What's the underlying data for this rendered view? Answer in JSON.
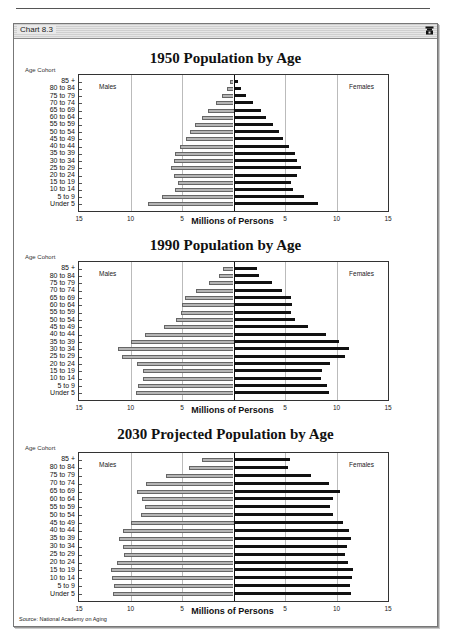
{
  "page": {
    "header_text": "Systemic Risk and Retirement"
  },
  "window": {
    "title": "Chart 8.3",
    "icon": "phone-icon",
    "source": "Source: National Academy on Aging"
  },
  "colors": {
    "male_bar": "#b5b5b5",
    "female_bar": "#111111",
    "gridline": "#bbbbbb"
  },
  "chart_data": [
    {
      "type": "bar",
      "orientation": "horizontal-pyramid",
      "title": "1950 Population by Age",
      "ylabel": "Age Cohort",
      "xlabel": "Millions of Persons",
      "xlim": [
        -15,
        15
      ],
      "xticks": [
        "15",
        "10",
        "5",
        "",
        "5",
        "10",
        "15"
      ],
      "grid": true,
      "side_labels": {
        "left": "Males",
        "right": "Females"
      },
      "categories": [
        "85 +",
        "80 to 84",
        "75 to 79",
        "70 to 74",
        "65 to 69",
        "60 to 64",
        "55 to 59",
        "50 to 54",
        "45 to 49",
        "40 to 44",
        "35 to 39",
        "30 to 34",
        "25 to 29",
        "20 to 24",
        "15 to 19",
        "10 to 14",
        "5 to 9",
        "Under 5"
      ],
      "series": [
        {
          "name": "Males",
          "values": [
            0.3,
            0.6,
            1.1,
            1.7,
            2.5,
            3.1,
            3.7,
            4.2,
            4.6,
            5.2,
            5.7,
            5.8,
            6.1,
            5.8,
            5.4,
            5.7,
            6.9,
            8.3
          ]
        },
        {
          "name": "Females",
          "values": [
            0.3,
            0.6,
            1.1,
            1.8,
            2.6,
            3.1,
            3.7,
            4.3,
            4.7,
            5.3,
            5.9,
            6.1,
            6.5,
            6.1,
            5.5,
            5.7,
            6.7,
            8.1
          ]
        }
      ]
    },
    {
      "type": "bar",
      "orientation": "horizontal-pyramid",
      "title": "1990 Population by Age",
      "ylabel": "Age Cohort",
      "xlabel": "Millions of Persons",
      "xlim": [
        -15,
        15
      ],
      "xticks": [
        "15",
        "10",
        "5",
        "",
        "5",
        "10",
        "15"
      ],
      "grid": true,
      "side_labels": {
        "left": "Males",
        "right": "Females"
      },
      "categories": [
        "85 +",
        "80 to 84",
        "75 to 79",
        "70 to 74",
        "65 to 69",
        "60 to 64",
        "55 to 59",
        "50 to 54",
        "45 to 49",
        "40 to 44",
        "35 to 39",
        "30 to 34",
        "25 to 29",
        "20 to 24",
        "15 to 19",
        "10 to 14",
        "5 to 9",
        "Under 5"
      ],
      "series": [
        {
          "name": "Males",
          "values": [
            1.0,
            1.4,
            2.4,
            3.6,
            4.7,
            5.0,
            5.1,
            5.6,
            6.7,
            8.6,
            10.0,
            11.2,
            10.8,
            9.4,
            8.8,
            8.8,
            9.3,
            9.5
          ]
        },
        {
          "name": "Females",
          "values": [
            2.2,
            2.4,
            3.6,
            4.6,
            5.5,
            5.6,
            5.5,
            5.9,
            7.1,
            8.9,
            10.1,
            11.1,
            10.7,
            9.3,
            8.5,
            8.4,
            9.0,
            9.2
          ]
        }
      ]
    },
    {
      "type": "bar",
      "orientation": "horizontal-pyramid",
      "title": "2030 Projected Population by Age",
      "ylabel": "Age Cohort",
      "xlabel": "Millions of Persons",
      "xlim": [
        -15,
        15
      ],
      "xticks": [
        "15",
        "10",
        "5",
        "",
        "5",
        "10",
        "15"
      ],
      "grid": true,
      "side_labels": {
        "left": "Males",
        "right": "Females"
      },
      "categories": [
        "85 +",
        "80 to 84",
        "75 to 79",
        "70 to 74",
        "65 to 69",
        "60 to 64",
        "55 to 59",
        "50 to 54",
        "45 to 49",
        "40 to 44",
        "35 to 39",
        "30 to 34",
        "25 to 29",
        "20 to 24",
        "15 to 19",
        "10 to 14",
        "5 to 9",
        "Under 5"
      ],
      "series": [
        {
          "name": "Males",
          "values": [
            3.1,
            4.3,
            6.6,
            8.5,
            9.4,
            8.9,
            8.6,
            9.0,
            10.0,
            10.7,
            11.1,
            10.7,
            10.6,
            11.3,
            11.9,
            11.8,
            11.6,
            11.7
          ]
        },
        {
          "name": "Females",
          "values": [
            5.4,
            5.2,
            7.4,
            9.2,
            10.2,
            9.6,
            9.3,
            9.6,
            10.5,
            11.1,
            11.3,
            10.9,
            10.7,
            11.0,
            11.5,
            11.4,
            11.2,
            11.3
          ]
        }
      ]
    }
  ]
}
